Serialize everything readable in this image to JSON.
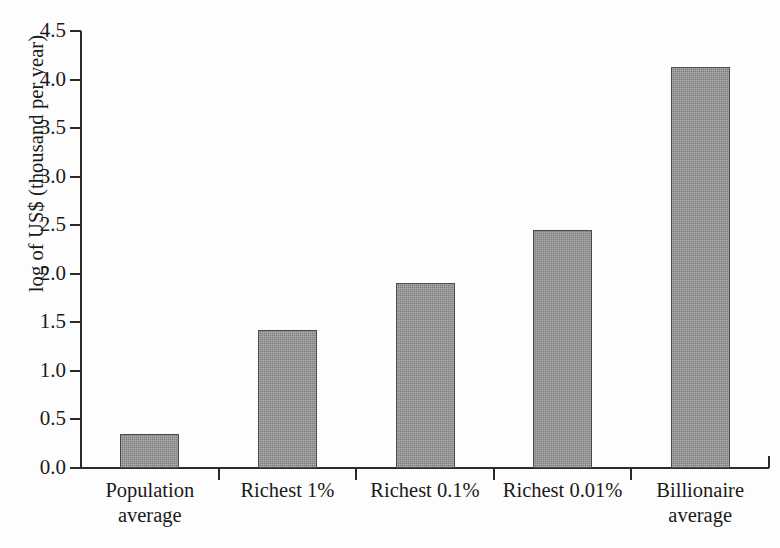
{
  "chart_data": {
    "type": "bar",
    "title": "",
    "xlabel": "",
    "ylabel": "log of US$ (thousand per year)",
    "categories": [
      "Population average",
      "Richest 1%",
      "Richest 0.1%",
      "Richest 0.01%",
      "Billionaire average"
    ],
    "category_lines": [
      [
        "Population",
        "average"
      ],
      [
        "Richest 1%",
        ""
      ],
      [
        "Richest 0.1%",
        ""
      ],
      [
        "Richest 0.01%",
        ""
      ],
      [
        "Billionaire",
        "average"
      ]
    ],
    "values": [
      0.35,
      1.42,
      1.9,
      2.45,
      4.13
    ],
    "ylim": [
      0.0,
      4.5
    ],
    "ytick_labels": [
      "0.0",
      "0.5",
      "1.0",
      "1.5",
      "2.0",
      "2.5",
      "3.0",
      "3.5",
      "4.0",
      "4.5"
    ],
    "ytick_values": [
      0.0,
      0.5,
      1.0,
      1.5,
      2.0,
      2.5,
      3.0,
      3.5,
      4.0,
      4.5
    ],
    "grid": false,
    "legend": null,
    "bar_color": "#8d8d8d",
    "bar_edge_color": "#4a4a4a",
    "axis_color": "#2b2b2b",
    "background_color": "#fdfdfd"
  }
}
